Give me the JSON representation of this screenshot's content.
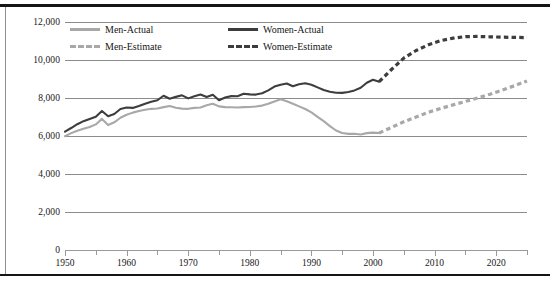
{
  "chart_data": {
    "type": "line",
    "title": "",
    "xlabel": "",
    "ylabel": "Number",
    "xlim": [
      1950,
      2025
    ],
    "ylim": [
      0,
      12000
    ],
    "grid": true,
    "legend_position": "top-left-inside",
    "y_ticks": [
      "0",
      "2,000",
      "4,000",
      "6,000",
      "8,000",
      "10,000",
      "12,000"
    ],
    "y_tick_values": [
      0,
      2000,
      4000,
      6000,
      8000,
      10000,
      12000
    ],
    "x_ticks": [
      "1950",
      "1960",
      "1970",
      "1980",
      "1990",
      "2000",
      "2010",
      "2020"
    ],
    "x_tick_values": [
      1950,
      1960,
      1970,
      1980,
      1990,
      2000,
      2010,
      2020
    ],
    "x_minor_tick_values": [
      1955,
      1965,
      1975,
      1985,
      1995,
      2005,
      2015,
      2025
    ],
    "colors": {
      "men": "#a8a8a8",
      "women": "#3d3d3d",
      "grid": "#8c8c8c",
      "rule": "#151515"
    },
    "series": [
      {
        "name": "Men-Actual",
        "style": "solid",
        "color": "#a8a8a8",
        "x": [
          1950,
          1951,
          1952,
          1953,
          1954,
          1955,
          1956,
          1957,
          1958,
          1959,
          1960,
          1961,
          1962,
          1963,
          1964,
          1965,
          1966,
          1967,
          1968,
          1969,
          1970,
          1971,
          1972,
          1973,
          1974,
          1975,
          1976,
          1977,
          1978,
          1979,
          1980,
          1981,
          1982,
          1983,
          1984,
          1985,
          1986,
          1987,
          1988,
          1989,
          1990,
          1991,
          1992,
          1993,
          1994,
          1995,
          1996,
          1997,
          1998,
          1999,
          2000,
          2001
        ],
        "values": [
          5990,
          6150,
          6280,
          6380,
          6470,
          6610,
          6900,
          6580,
          6720,
          6960,
          7120,
          7230,
          7320,
          7380,
          7430,
          7450,
          7520,
          7580,
          7490,
          7440,
          7430,
          7480,
          7500,
          7620,
          7700,
          7560,
          7520,
          7510,
          7500,
          7520,
          7530,
          7550,
          7600,
          7700,
          7820,
          7930,
          7830,
          7700,
          7560,
          7420,
          7240,
          7010,
          6780,
          6520,
          6290,
          6160,
          6110,
          6120,
          6080,
          6150,
          6180,
          6160
        ]
      },
      {
        "name": "Women-Actual",
        "style": "solid",
        "color": "#3d3d3d",
        "x": [
          1950,
          1951,
          1952,
          1953,
          1954,
          1955,
          1956,
          1957,
          1958,
          1959,
          1960,
          1961,
          1962,
          1963,
          1964,
          1965,
          1966,
          1967,
          1968,
          1969,
          1970,
          1971,
          1972,
          1973,
          1974,
          1975,
          1976,
          1977,
          1978,
          1979,
          1980,
          1981,
          1982,
          1983,
          1984,
          1985,
          1986,
          1987,
          1988,
          1989,
          1990,
          1991,
          1992,
          1993,
          1994,
          1995,
          1996,
          1997,
          1998,
          1999,
          2000,
          2001
        ],
        "values": [
          6230,
          6420,
          6620,
          6780,
          6900,
          7010,
          7320,
          7040,
          7160,
          7420,
          7500,
          7480,
          7580,
          7700,
          7800,
          7880,
          8120,
          7960,
          8060,
          8140,
          7980,
          8090,
          8180,
          8050,
          8170,
          7880,
          8030,
          8100,
          8090,
          8220,
          8190,
          8180,
          8250,
          8400,
          8600,
          8700,
          8760,
          8620,
          8720,
          8780,
          8700,
          8560,
          8420,
          8330,
          8280,
          8270,
          8320,
          8400,
          8540,
          8800,
          8960,
          8860
        ]
      },
      {
        "name": "Men-Estimate",
        "style": "dashed",
        "color": "#a8a8a8",
        "x": [
          2001,
          2003,
          2005,
          2007,
          2009,
          2011,
          2013,
          2015,
          2017,
          2019,
          2021,
          2023,
          2025
        ],
        "values": [
          6160,
          6450,
          6750,
          7000,
          7250,
          7450,
          7640,
          7820,
          8000,
          8200,
          8420,
          8650,
          8900
        ]
      },
      {
        "name": "Women-Estimate",
        "style": "dashed",
        "color": "#3d3d3d",
        "x": [
          2001,
          2003,
          2005,
          2007,
          2009,
          2011,
          2013,
          2015,
          2017,
          2019,
          2021,
          2023,
          2025
        ],
        "values": [
          8860,
          9500,
          10100,
          10500,
          10800,
          11020,
          11150,
          11230,
          11240,
          11220,
          11200,
          11190,
          11180
        ]
      }
    ]
  },
  "legend": {
    "items": [
      {
        "label": "Men-Actual",
        "style": "solid",
        "color": "#a8a8a8"
      },
      {
        "label": "Women-Actual",
        "style": "solid",
        "color": "#3d3d3d"
      },
      {
        "label": "Men-Estimate",
        "style": "dashed",
        "color": "#a8a8a8"
      },
      {
        "label": "Women-Estimate",
        "style": "dashed",
        "color": "#3d3d3d"
      }
    ]
  }
}
